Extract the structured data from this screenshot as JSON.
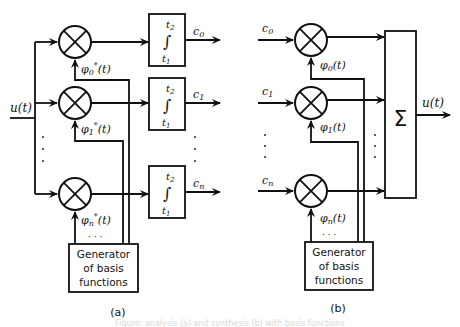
{
  "diagram": {
    "panel_a": {
      "caption": "(a)",
      "input_label": "u(t)",
      "multipliers": [
        {
          "basis_label": "φ0*(t)",
          "basis_main": "φ",
          "basis_sub": "0",
          "basis_sup": "*",
          "basis_arg": "(t)"
        },
        {
          "basis_label": "φ1*(t)",
          "basis_main": "φ",
          "basis_sub": "1",
          "basis_sup": "*",
          "basis_arg": "(t)"
        },
        {
          "basis_label": "φn*(t)",
          "basis_main": "φ",
          "basis_sub": "n",
          "basis_sup": "*",
          "basis_arg": "(t)"
        }
      ],
      "integrators": [
        {
          "upper_limit": "t2",
          "lower_limit": "t1",
          "symbol": "∫",
          "output": "c0",
          "out_main": "c",
          "out_sub": "0"
        },
        {
          "upper_limit": "t2",
          "lower_limit": "t1",
          "symbol": "∫",
          "output": "c1",
          "out_main": "c",
          "out_sub": "1"
        },
        {
          "upper_limit": "t2",
          "lower_limit": "t1",
          "symbol": "∫",
          "output": "cn",
          "out_main": "c",
          "out_sub": "n"
        }
      ],
      "generator": {
        "lines": [
          "Generator",
          "of basis",
          "functions"
        ]
      },
      "ellipsis": "· · ·"
    },
    "panel_b": {
      "caption": "(b)",
      "output_label": "u(t)",
      "summer_symbol": "Σ",
      "inputs": [
        {
          "label": "c0",
          "main": "c",
          "sub": "0",
          "basis_label": "φ0(t)",
          "basis_main": "φ",
          "basis_sub": "0",
          "basis_arg": "(t)"
        },
        {
          "label": "c1",
          "main": "c",
          "sub": "1",
          "basis_label": "φ1(t)",
          "basis_main": "φ",
          "basis_sub": "1",
          "basis_arg": "(t)"
        },
        {
          "label": "cn",
          "main": "c",
          "sub": "n",
          "basis_label": "φn(t)",
          "basis_main": "φ",
          "basis_sub": "n",
          "basis_arg": "(t)"
        }
      ],
      "generator": {
        "lines": [
          "Generator",
          "of basis",
          "functions"
        ]
      },
      "ellipsis": "· · ·"
    },
    "faint_caption": "Figure: analysis (a) and synthesis (b) with basis functions"
  }
}
